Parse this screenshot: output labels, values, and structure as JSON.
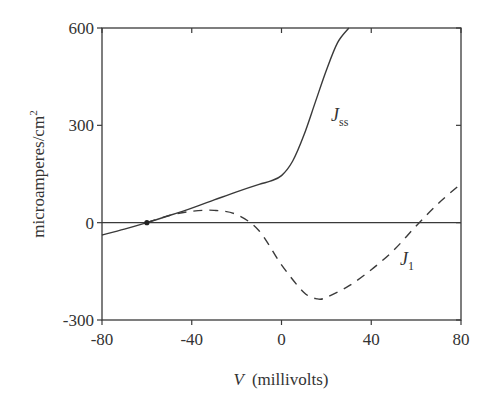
{
  "chart_data": {
    "type": "line",
    "title": "",
    "xlabel": "V (millivolts)",
    "xlabel_var": "V",
    "xlabel_unit": "(millivolts)",
    "ylabel": "microamperes/cm2",
    "ylabel_text": "microamperes/cm",
    "ylabel_sup": "2",
    "xlim": [
      -80,
      80
    ],
    "ylim": [
      -300,
      600
    ],
    "xticks": [
      -80,
      -40,
      0,
      40,
      80
    ],
    "xtick_labels": [
      "-80",
      "-40",
      "0",
      "40",
      "80"
    ],
    "yticks": [
      -300,
      0,
      300,
      600
    ],
    "ytick_labels": [
      "-300",
      "0",
      "300",
      "600"
    ],
    "grid": false,
    "legend": "inline curve labels",
    "horizontal_reference_line": 0,
    "marker_point": {
      "x": -60,
      "y": 0
    },
    "series": [
      {
        "name": "Jss",
        "label_main": "J",
        "label_sub": "ss",
        "style": "solid",
        "x": [
          -80,
          -70,
          -60,
          -50,
          -40,
          -30,
          -20,
          -10,
          -5,
          0,
          5,
          10,
          15,
          20,
          25,
          30
        ],
        "y": [
          -38,
          -20,
          0,
          22,
          45,
          70,
          95,
          118,
          128,
          145,
          190,
          270,
          370,
          470,
          555,
          600
        ]
      },
      {
        "name": "J1",
        "label_main": "J",
        "label_sub": "1",
        "style": "dashed",
        "x": [
          -60,
          -50,
          -40,
          -30,
          -20,
          -10,
          0,
          10,
          16,
          20,
          30,
          40,
          50,
          60,
          70,
          80
        ],
        "y": [
          0,
          22,
          35,
          38,
          25,
          -25,
          -130,
          -215,
          -235,
          -230,
          -195,
          -145,
          -85,
          -10,
          60,
          120
        ]
      }
    ]
  }
}
